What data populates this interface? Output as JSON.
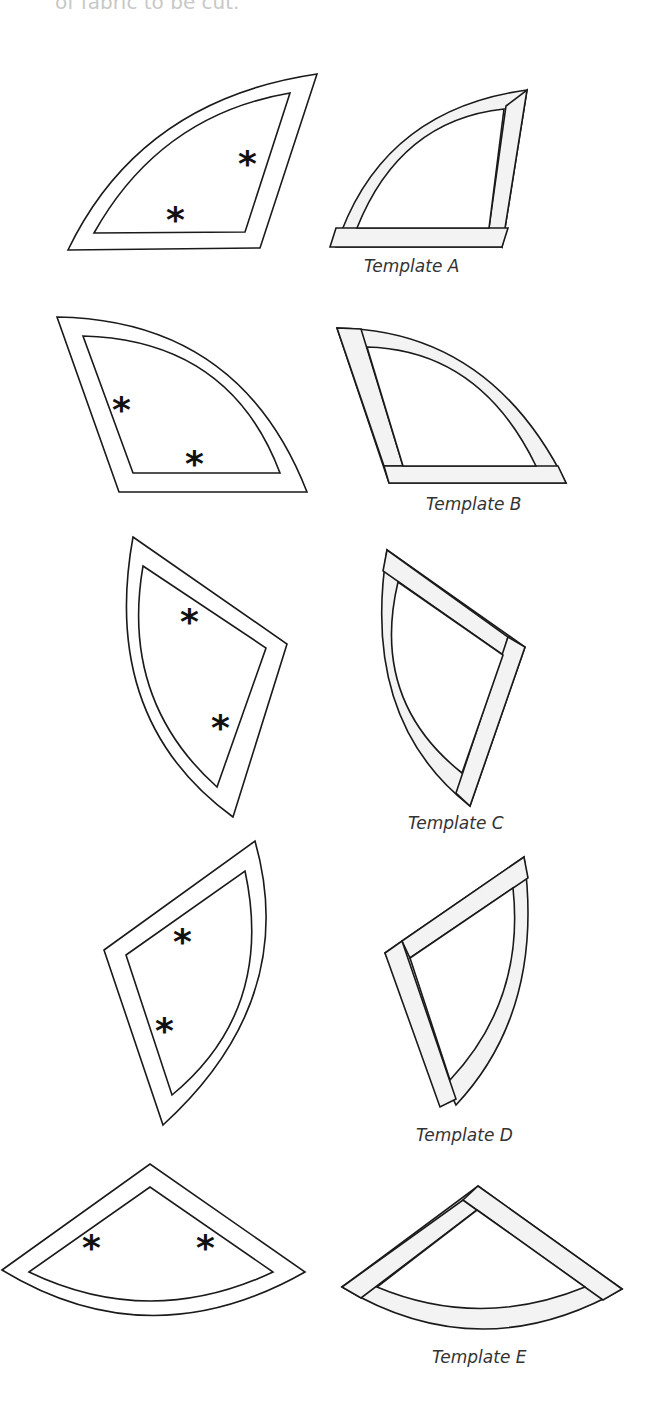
{
  "header": {
    "cut_off_text": "of fabric to be cut."
  },
  "templates": [
    {
      "id": "A",
      "label": "Template A"
    },
    {
      "id": "B",
      "label": "Template B"
    },
    {
      "id": "C",
      "label": "Template C"
    },
    {
      "id": "D",
      "label": "Template D"
    },
    {
      "id": "E",
      "label": "Template E"
    }
  ],
  "marker": {
    "symbol": "*",
    "meaning": "grain-line marker"
  },
  "colors": {
    "outline": "#1a1a1a",
    "seam_strip": "#f3f3f3",
    "background": "#ffffff"
  }
}
